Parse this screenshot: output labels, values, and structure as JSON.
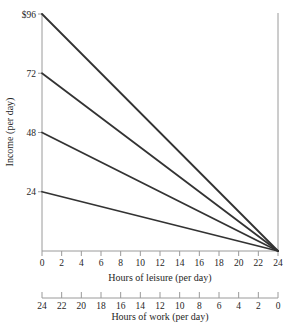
{
  "colors": {
    "background": "#ffffff",
    "budget_line": "#333333",
    "axis_line": "#9a9a9a",
    "tick_mark": "#9a9a9a",
    "text": "#262626"
  },
  "chart_data": {
    "type": "line",
    "title": "",
    "xlabel": "Hours of leisure (per day)",
    "ylabel": "Income (per day)",
    "x2label": "Hours of work (per day)",
    "xlim": [
      0,
      24
    ],
    "ylim": [
      0,
      96
    ],
    "grid": false,
    "legend": false,
    "x_ticks": [
      0,
      2,
      4,
      6,
      8,
      10,
      12,
      14,
      16,
      18,
      20,
      22,
      24
    ],
    "x2_ticks": [
      24,
      22,
      20,
      18,
      16,
      14,
      12,
      10,
      8,
      6,
      4,
      2,
      0
    ],
    "y_ticks": [
      {
        "value": 96,
        "label": "$96"
      },
      {
        "value": 72,
        "label": "72"
      },
      {
        "value": 48,
        "label": "48"
      },
      {
        "value": 24,
        "label": "24"
      }
    ],
    "series": [
      {
        "name": "budget-line-96",
        "points": [
          [
            0,
            96
          ],
          [
            24,
            0
          ]
        ]
      },
      {
        "name": "budget-line-72",
        "points": [
          [
            0,
            72
          ],
          [
            24,
            0
          ]
        ]
      },
      {
        "name": "budget-line-48",
        "points": [
          [
            0,
            48
          ],
          [
            24,
            0
          ]
        ]
      },
      {
        "name": "budget-line-24",
        "points": [
          [
            0,
            24
          ],
          [
            24,
            0
          ]
        ]
      }
    ],
    "right_boundary_x": 24
  }
}
